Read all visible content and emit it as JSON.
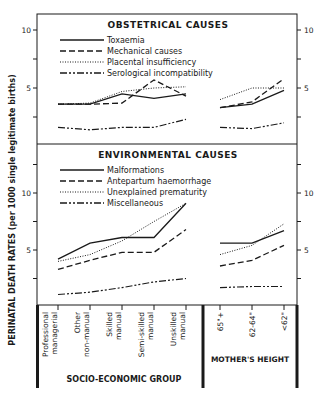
{
  "figure": {
    "y_axis_label": "PERINATAL DEATH RATES (per 1000 single legitimate births)",
    "group_labels": [
      "SOCIO-ECONOMIC GROUP",
      "MOTHER'S HEIGHT"
    ]
  },
  "chart_data": [
    {
      "type": "line",
      "title": "OBSTETRICAL CAUSES",
      "ylabel": "Perinatal death rates (per 1000 single legitimate births)",
      "ylim": [
        0,
        11
      ],
      "yticks_labeled": [
        5,
        10
      ],
      "yticks_minor": [
        2.5,
        7.5
      ],
      "grid": false,
      "legend_position": "upper-left-inside",
      "groups": [
        {
          "name": "SOCIO-ECONOMIC GROUP",
          "categories": [
            "Professional, managerial",
            "Other non-manual",
            "Skilled manual",
            "Semi-skilled manual",
            "Unskilled manual"
          ],
          "series": [
            {
              "name": "Toxaemia",
              "style": "solid",
              "values": [
                3.6,
                3.6,
                4.5,
                4.1,
                4.5
              ]
            },
            {
              "name": "Mechanical causes",
              "style": "long-dash",
              "values": [
                3.6,
                3.6,
                3.7,
                5.7,
                4.3
              ]
            },
            {
              "name": "Placental insufficiency",
              "style": "dotted",
              "values": [
                3.6,
                3.7,
                4.7,
                5.0,
                5.1
              ]
            },
            {
              "name": "Serological incompatibility",
              "style": "dash-dot",
              "values": [
                1.6,
                1.4,
                1.6,
                1.6,
                2.3
              ]
            }
          ]
        },
        {
          "name": "MOTHER'S HEIGHT",
          "categories": [
            "65\"+",
            "62-64\"",
            "<62\""
          ],
          "series": [
            {
              "name": "Toxaemia",
              "style": "solid",
              "values": [
                3.3,
                3.6,
                4.8
              ]
            },
            {
              "name": "Mechanical causes",
              "style": "long-dash",
              "values": [
                3.3,
                3.8,
                5.8
              ]
            },
            {
              "name": "Placental insufficiency",
              "style": "dotted",
              "values": [
                4.0,
                5.0,
                5.0
              ]
            },
            {
              "name": "Serological incompatibility",
              "style": "dash-dot",
              "values": [
                1.6,
                1.5,
                2.0
              ]
            }
          ]
        }
      ]
    },
    {
      "type": "line",
      "title": "ENVIRONMENTAL CAUSES",
      "ylabel": "Perinatal death rates (per 1000 single legitimate births)",
      "ylim": [
        0,
        14
      ],
      "yticks_labeled": [
        5,
        10
      ],
      "yticks_minor": [
        2.5,
        7.5,
        12.5
      ],
      "grid": false,
      "legend_position": "upper-left-inside",
      "groups": [
        {
          "name": "SOCIO-ECONOMIC GROUP",
          "categories": [
            "Professional, managerial",
            "Other non-manual",
            "Skilled manual",
            "Semi-skilled manual",
            "Unskilled manual"
          ],
          "series": [
            {
              "name": "Malformations",
              "style": "solid",
              "values": [
                4.2,
                5.6,
                6.1,
                6.1,
                9.1
              ]
            },
            {
              "name": "Antepartum haemorrhage",
              "style": "long-dash",
              "values": [
                3.3,
                4.1,
                4.8,
                4.8,
                6.8
              ]
            },
            {
              "name": "Unexplained prematurity",
              "style": "dotted",
              "values": [
                4.0,
                4.6,
                5.8,
                7.5,
                9.1
              ]
            },
            {
              "name": "Miscellaneous",
              "style": "dash-dot",
              "values": [
                1.1,
                1.3,
                1.7,
                2.2,
                2.5
              ]
            }
          ]
        },
        {
          "name": "MOTHER'S HEIGHT",
          "categories": [
            "65\"+",
            "62-64\"",
            "<62\""
          ],
          "series": [
            {
              "name": "Malformations",
              "style": "solid",
              "values": [
                5.6,
                5.6,
                6.7
              ]
            },
            {
              "name": "Antepartum haemorrhage",
              "style": "long-dash",
              "values": [
                3.6,
                4.1,
                5.4
              ]
            },
            {
              "name": "Unexplained prematurity",
              "style": "dotted",
              "values": [
                4.6,
                5.4,
                7.3
              ]
            },
            {
              "name": "Miscellaneous",
              "style": "dash-dot",
              "values": [
                1.7,
                1.8,
                1.8
              ]
            }
          ]
        }
      ]
    }
  ],
  "x_labels": {
    "socio": [
      [
        "Professional",
        "managerial"
      ],
      [
        "Other",
        "non-manual"
      ],
      [
        "Skilled",
        "manual"
      ],
      [
        "Semi-skilled",
        "manual"
      ],
      [
        "Unskilled",
        "manual"
      ]
    ],
    "height": [
      "65\"+",
      "62-64\"",
      "<62\""
    ]
  }
}
